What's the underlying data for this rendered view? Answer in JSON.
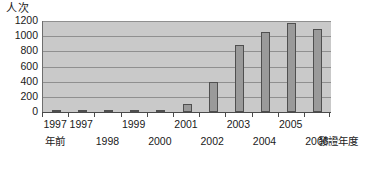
{
  "chart_data": {
    "type": "bar",
    "title": "",
    "subtitle": "",
    "xlabel": "發證年度",
    "ylabel": "人次",
    "ylim": [
      0,
      1200
    ],
    "ytick_labels": [
      "1200",
      "1000",
      "800",
      "600",
      "400",
      "200",
      "0"
    ],
    "ytick_values": [
      1200,
      1000,
      800,
      600,
      400,
      200,
      0
    ],
    "grid": true,
    "legend": false,
    "categories": [
      "1997年前",
      "1997",
      "1998",
      "1999",
      "2000",
      "2001",
      "2002",
      "2003",
      "2004",
      "2005",
      "2006"
    ],
    "values": [
      10,
      8,
      10,
      12,
      10,
      100,
      400,
      880,
      1060,
      1170,
      1100
    ],
    "series": [
      {
        "name": "人次",
        "values": [
          10,
          8,
          10,
          12,
          10,
          100,
          400,
          880,
          1060,
          1170,
          1100
        ]
      }
    ],
    "colors": {
      "plot_background": "#c9c9c9",
      "bar_fill": "#9a9a9a",
      "bar_border": "#4f4f4f",
      "gridline": "#8f8f8f",
      "axis": "#4a4a4a",
      "text": "#1a1a1a",
      "page_background": "#ffffff"
    }
  },
  "axes": {
    "y_unit_caption": "人次",
    "x_unit_caption": "發證年度"
  },
  "x_tick_labels": [
    {
      "text": "1997",
      "row": "top"
    },
    {
      "text": "年前",
      "row": "bottom"
    },
    {
      "text": "1997",
      "row": "top"
    },
    {
      "text": "1998",
      "row": "bottom"
    },
    {
      "text": "1999",
      "row": "top"
    },
    {
      "text": "2000",
      "row": "bottom"
    },
    {
      "text": "2001",
      "row": "top"
    },
    {
      "text": "2002",
      "row": "bottom"
    },
    {
      "text": "2003",
      "row": "top"
    },
    {
      "text": "2004",
      "row": "bottom"
    },
    {
      "text": "2005",
      "row": "top"
    },
    {
      "text": "2006",
      "row": "bottom"
    }
  ]
}
